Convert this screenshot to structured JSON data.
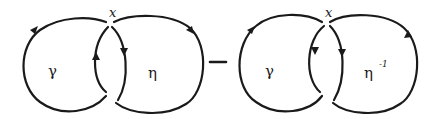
{
  "diagram": {
    "stroke_color": "#1a1a1a",
    "background": "#ffffff",
    "left_figure": {
      "base_point_label": "x",
      "loop_a_label": "γ",
      "loop_b_label": "η",
      "loop_b_superscript": ""
    },
    "operator": "−",
    "right_figure": {
      "base_point_label": "x",
      "loop_a_label": "γ",
      "loop_b_label": "η",
      "loop_b_superscript": "-1"
    }
  }
}
